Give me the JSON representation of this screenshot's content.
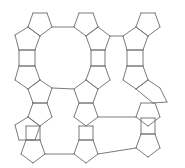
{
  "diagram": {
    "line_color": "#7a7a7a",
    "background": "#ffffff",
    "tile_types": [
      "pentagon",
      "square",
      "large-ring"
    ],
    "columns": 3,
    "rows": 3
  }
}
